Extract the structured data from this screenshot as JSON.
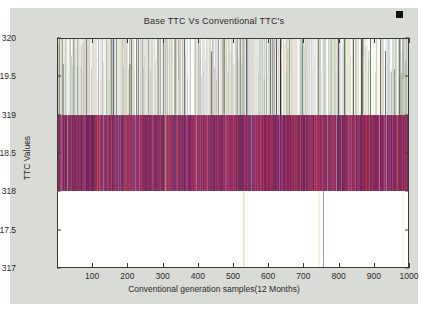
{
  "figure": {
    "background_color": "#d9dbd6",
    "plot_background_color": "#ffffff",
    "axis_color": "#3a3a3a",
    "marker_color": "#111111"
  },
  "chart_data": {
    "type": "bar",
    "title": "Base TTC Vs Conventional TTC's",
    "xlabel": "Conventional generation samples(12 Months)",
    "ylabel": "TTC Values",
    "xlim": [
      0,
      1000
    ],
    "ylim": [
      317,
      320
    ],
    "xticks": [
      100,
      200,
      300,
      400,
      500,
      600,
      700,
      800,
      900,
      1000
    ],
    "xtick_labels": [
      "100",
      "200",
      "300",
      "400",
      "500",
      "600",
      "700",
      "800",
      "900",
      "1000"
    ],
    "yticks": [
      317,
      317.5,
      318,
      318.5,
      319,
      319.5,
      320
    ],
    "ytick_labels": [
      "317",
      "317.5",
      "318",
      "318.5",
      "319",
      "319.5",
      "320"
    ],
    "grid": false,
    "legend": null,
    "baseline": 318,
    "bar_count": 1000,
    "band_split": 319,
    "upper_band_range": [
      319,
      320
    ],
    "lower_band_range": [
      318,
      319
    ],
    "outliers": [
      {
        "x": 530,
        "value": 317.0,
        "color": "#c8c87a"
      },
      {
        "x": 745,
        "value": 317.0,
        "color": "#e8e0a8"
      },
      {
        "x": 757,
        "value": 317.0,
        "color": "#9b6ea8"
      },
      {
        "x": 985,
        "value": 317.0,
        "color": "#efe9b4"
      }
    ],
    "palette_upper": [
      "#e6dcd2",
      "#9fc08a",
      "#ffffff",
      "#cfd8e8",
      "#efe7c8",
      "#b8c8a0",
      "#f2efe4",
      "#d8cfe0",
      "#2b2b2b",
      "#c9d9c2",
      "#e8dcc0",
      "#a8b8d8",
      "#f0e8d8",
      "#8faa7a",
      "#ded6e8",
      "#fbf7ec",
      "#c0b8a0",
      "#b9d0b0",
      "#e4cfcf",
      "#d0c8b0",
      "#ffffff",
      "#a9bed2",
      "#e9e2cc",
      "#7f9a68",
      "#dcd2e6",
      "#f5f0e0",
      "#bfb9a8",
      "#cddbd2"
    ],
    "palette_lower": [
      "#8e1f5e",
      "#5c2a72",
      "#a81a55",
      "#6b1f4e",
      "#c0306a",
      "#4a2060",
      "#932a7a",
      "#7d1840",
      "#b02a60",
      "#55306b",
      "#8c3a3a",
      "#a02050",
      "#6e2a80",
      "#c43a6e",
      "#3f1c52",
      "#9a2f44",
      "#7a4080",
      "#b8426b",
      "#5e2448",
      "#882a66",
      "#a83a52",
      "#6a3070",
      "#93214e",
      "#be3a78",
      "#4d2a5e",
      "#aa2f5a",
      "#72245a",
      "#c02a44"
    ]
  },
  "axis_ticks": {
    "y": [
      {
        "label": "320",
        "value": 320
      },
      {
        "label": "319.5",
        "value": 319.5
      },
      {
        "label": "319",
        "value": 319
      },
      {
        "label": "318.5",
        "value": 318.5
      },
      {
        "label": "318",
        "value": 318
      },
      {
        "label": "317.5",
        "value": 317.5
      },
      {
        "label": "317",
        "value": 317
      }
    ]
  }
}
